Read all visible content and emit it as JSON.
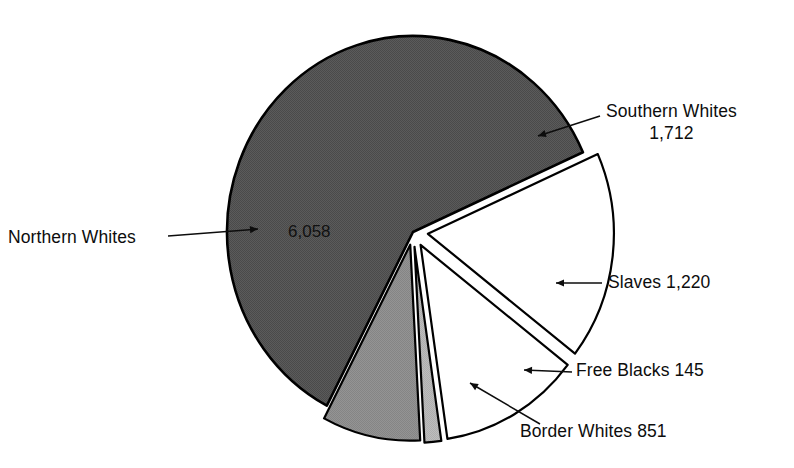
{
  "chart_data": {
    "type": "pie",
    "title": "",
    "subtitle": "",
    "xlabel": "",
    "ylabel": "",
    "units": "thousands of people",
    "total": 9986,
    "legend_position": "callout-labels",
    "grid": false,
    "categories": [
      "Northern Whites",
      "Southern Whites",
      "Slaves",
      "Free Blacks",
      "Border Whites"
    ],
    "values": [
      6058,
      1712,
      1220,
      145,
      851
    ],
    "value_labels": [
      "6,058",
      "1,712",
      "1,220",
      "145",
      "851"
    ],
    "slices": [
      {
        "name": "Northern Whites",
        "value": 6058,
        "value_label": "6,058",
        "percent": 60.7,
        "fill": "#595959",
        "stroke": "#000000",
        "exploded": false,
        "label_text": "Northern Whites",
        "label_placement": "left-outside",
        "value_placement": "inside"
      },
      {
        "name": "Southern Whites",
        "value": 1712,
        "value_label": "1,712",
        "percent": 17.1,
        "fill": "#ffffff",
        "stroke": "#000000",
        "exploded": true,
        "label_text": "Southern Whites",
        "label_value": "1,712",
        "label_placement": "right-upper"
      },
      {
        "name": "Slaves",
        "value": 1220,
        "value_label": "1,220",
        "percent": 12.2,
        "fill": "#ffffff",
        "stroke": "#000000",
        "exploded": true,
        "label_text": "Slaves 1,220",
        "label_placement": "right-middle"
      },
      {
        "name": "Free Blacks",
        "value": 145,
        "value_label": "145",
        "percent": 1.5,
        "fill": "#b8b8b8",
        "stroke": "#000000",
        "exploded": true,
        "label_text": "Free Blacks 145",
        "label_placement": "right-lower"
      },
      {
        "name": "Border Whites",
        "value": 851,
        "value_label": "851",
        "percent": 8.5,
        "fill": "#8f8f8f",
        "stroke": "#000000",
        "exploded": true,
        "label_text": "Border Whites 851",
        "label_placement": "bottom-right"
      }
    ]
  },
  "labels": {
    "northern_whites": "Northern Whites",
    "northern_whites_value": "6,058",
    "southern_whites_line1": "Southern Whites",
    "southern_whites_line2": "1,712",
    "slaves": "Slaves 1,220",
    "free_blacks": "Free Blacks 145",
    "border_whites": "Border Whites 851"
  },
  "colors": {
    "background": "#ffffff",
    "text": "#0d0d0d",
    "outline": "#000000",
    "northern_fill": "#595959",
    "border_fill": "#8f8f8f",
    "free_blacks_fill": "#b8b8b8",
    "white_fill": "#ffffff"
  }
}
